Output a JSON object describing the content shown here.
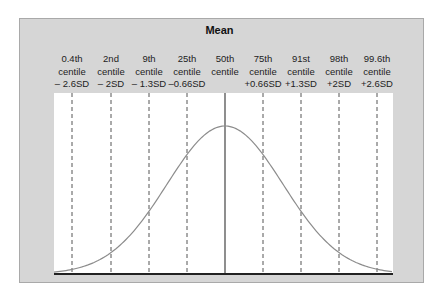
{
  "title": "Mean",
  "colors": {
    "frame_bg": "#d6d6d6",
    "plot_bg": "#ffffff",
    "curve": "#8c8c8c",
    "dashed": "#555555",
    "mean_line": "#444444",
    "baseline": "#222222"
  },
  "labels": [
    {
      "line1": "0.4th",
      "line2": "centile",
      "line3": "– 2.6SD"
    },
    {
      "line1": "2nd",
      "line2": "centile",
      "line3": "– 2SD"
    },
    {
      "line1": "9th",
      "line2": "centile",
      "line3": "– 1.3SD"
    },
    {
      "line1": "25th",
      "line2": "centile",
      "line3": "–0.66SD"
    },
    {
      "line1": "50th",
      "line2": "centile",
      "line3": ""
    },
    {
      "line1": "75th",
      "line2": "centile",
      "line3": "+0.66SD"
    },
    {
      "line1": "91st",
      "line2": "centile",
      "line3": "+1.3SD"
    },
    {
      "line1": "98th",
      "line2": "centile",
      "line3": "+2SD"
    },
    {
      "line1": "99.6th",
      "line2": "centile",
      "line3": "+2.6SD"
    }
  ],
  "chart_data": {
    "type": "line",
    "title": "Mean",
    "markers": [
      {
        "centile": "0.4th",
        "sd": -2.6
      },
      {
        "centile": "2nd",
        "sd": -2
      },
      {
        "centile": "9th",
        "sd": -1.3
      },
      {
        "centile": "25th",
        "sd": -0.66
      },
      {
        "centile": "50th",
        "sd": 0,
        "style": "solid"
      },
      {
        "centile": "75th",
        "sd": 0.66
      },
      {
        "centile": "91st",
        "sd": 1.3
      },
      {
        "centile": "98th",
        "sd": 2
      },
      {
        "centile": "99.6th",
        "sd": 2.6
      }
    ],
    "xlabel": "",
    "ylabel": "",
    "xlim": [
      -3,
      3
    ],
    "grid": false,
    "legend": "none"
  }
}
